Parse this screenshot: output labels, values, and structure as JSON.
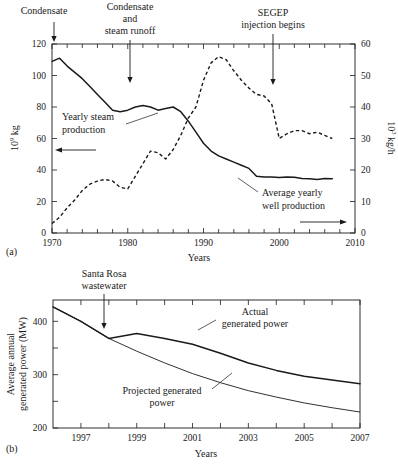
{
  "figure": {
    "panel_a_label": "(a)",
    "panel_b_label": "(b)"
  },
  "chart_data": [
    {
      "id": "a",
      "type": "line",
      "title": "",
      "xlabel": "Years",
      "ylabel": "10⁹ kg",
      "ylabel_base": "10",
      "ylabel_exp": "9",
      "ylabel_unit": " kg",
      "y2label": "10³ kg/h",
      "y2label_base": "10",
      "y2label_exp": "3",
      "y2label_unit": " kg/h",
      "xlim": [
        1970,
        2010
      ],
      "ylim": [
        0,
        120
      ],
      "y2lim": [
        0,
        60
      ],
      "xticks": [
        1970,
        1980,
        1990,
        2000,
        2010
      ],
      "xtick_labels": [
        "1970",
        "1980",
        "1990",
        "2000",
        "2010"
      ],
      "xtick_minor_step": 2,
      "yticks": [
        0,
        20,
        40,
        60,
        80,
        100,
        120
      ],
      "ytick_labels": [
        "0",
        "20",
        "40",
        "60",
        "80",
        "100",
        "120"
      ],
      "y2ticks": [
        0,
        10,
        20,
        30,
        40,
        50,
        60
      ],
      "y2tick_labels": [
        "0",
        "10",
        "20",
        "30",
        "40",
        "50",
        "60"
      ],
      "grid": false,
      "legend": "inline-annotations",
      "series": [
        {
          "name": "Average yearly well production",
          "style": "solid",
          "axis": "right",
          "label": "Average yearly\nwell production",
          "label_line1": "Average yearly",
          "label_line2": "well production",
          "x": [
            1970,
            1971,
            1972,
            1973,
            1974,
            1975,
            1976,
            1977,
            1978,
            1979,
            1980,
            1981,
            1982,
            1983,
            1984,
            1985,
            1986,
            1987,
            1988,
            1989,
            1990,
            1991,
            1992,
            1993,
            1994,
            1995,
            1996,
            1997,
            1998,
            1999,
            2000,
            2001,
            2002,
            2003,
            2004,
            2005,
            2006,
            2007
          ],
          "values": [
            54.5,
            55.5,
            53.0,
            51.0,
            49.0,
            46.5,
            44.0,
            41.5,
            39.0,
            38.5,
            39.0,
            40.0,
            40.5,
            40.0,
            39.0,
            39.5,
            40.0,
            38.5,
            35.5,
            32.0,
            28.5,
            26.0,
            24.5,
            23.5,
            22.5,
            21.5,
            20.5,
            18.0,
            17.8,
            17.8,
            17.6,
            17.8,
            17.7,
            17.3,
            17.2,
            17.0,
            17.3,
            17.2
          ]
        },
        {
          "name": "Yearly steam production",
          "style": "dashed",
          "axis": "left",
          "label": "Yearly steam production",
          "label_line1": "Yearly steam",
          "label_line2": "production",
          "x": [
            1970,
            1971,
            1972,
            1973,
            1974,
            1975,
            1976,
            1977,
            1978,
            1979,
            1980,
            1981,
            1982,
            1983,
            1984,
            1985,
            1986,
            1987,
            1988,
            1989,
            1990,
            1991,
            1992,
            1993,
            1994,
            1995,
            1996,
            1997,
            1998,
            1999,
            2000,
            2001,
            2002,
            2003,
            2004,
            2005,
            2006,
            2007
          ],
          "values": [
            6,
            10,
            16,
            21,
            27,
            31,
            33,
            34,
            33,
            29,
            28,
            36,
            44,
            52,
            51,
            47,
            53,
            62,
            73,
            80,
            97,
            108,
            112,
            110,
            103,
            97,
            92,
            88,
            87,
            82,
            60,
            63,
            65,
            65,
            63,
            64,
            62,
            60
          ]
        }
      ],
      "annotations": [
        {
          "name": "condensate",
          "text": "Condensate",
          "lines": [
            "Condensate"
          ],
          "x": 1971,
          "arrow": true
        },
        {
          "name": "condensate-and-steam-runoff",
          "text": "Condensate and steam runoff",
          "lines": [
            "Condensate",
            "and",
            "steam runoff"
          ],
          "x": 1981,
          "arrow": true
        },
        {
          "name": "segep-injection-begins",
          "text": "SEGEP injection begins",
          "lines": [
            "SEGEP",
            "injection begins"
          ],
          "x": 1998,
          "arrow": true
        }
      ]
    },
    {
      "id": "b",
      "type": "line",
      "title": "",
      "xlabel": "Years",
      "ylabel": "Average annual generated power (MW)",
      "ylabel_line1": "Average annual",
      "ylabel_line2": "generated power (MW)",
      "xlim": [
        1996,
        2007
      ],
      "ylim": [
        200,
        440
      ],
      "xticks": [
        1997,
        1998,
        1999,
        2000,
        2001,
        2002,
        2003,
        2004,
        2005,
        2006,
        2007
      ],
      "xtick_labels": [
        "1997",
        "",
        "1999",
        "",
        "2001",
        "",
        "2003",
        "",
        "2005",
        "",
        "2007"
      ],
      "yticks": [
        200,
        250,
        300,
        350,
        400
      ],
      "ytick_labels": [
        "200",
        "",
        "300",
        "",
        "400"
      ],
      "grid": false,
      "series": [
        {
          "name": "Actual generated power",
          "style": "solid",
          "label_line1": "Actual",
          "label_line2": "generated power",
          "x": [
            1996,
            1997,
            1998,
            1999,
            2000,
            2001,
            2002,
            2003,
            2004,
            2005,
            2006,
            2007
          ],
          "values": [
            427,
            400,
            368,
            377,
            368,
            357,
            340,
            322,
            308,
            297,
            290,
            283
          ]
        },
        {
          "name": "Projected generated power",
          "style": "thin",
          "label_line1": "Projected generated",
          "label_line2": "power",
          "x": [
            1996,
            1997,
            1998,
            1999,
            2000,
            2001,
            2002,
            2003,
            2004,
            2005,
            2006,
            2007
          ],
          "values": [
            427,
            400,
            368,
            344,
            322,
            302,
            285,
            270,
            258,
            247,
            238,
            230
          ]
        }
      ],
      "annotations": [
        {
          "name": "santa-rosa-wastewater",
          "text": "Santa Rosa wastewater",
          "lines": [
            "Santa Rosa",
            "wastewater"
          ],
          "x": 1998,
          "arrow": true
        }
      ]
    }
  ]
}
